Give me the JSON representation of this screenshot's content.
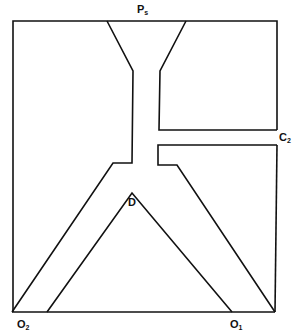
{
  "diagram": {
    "type": "fluidic-device-channel-schematic",
    "stroke_color": "#111111",
    "background": "#ffffff",
    "labels": {
      "supply": {
        "main": "P",
        "sub": "s"
      },
      "control": {
        "main": "C",
        "sub": "2"
      },
      "divider": {
        "main": "D",
        "sub": ""
      },
      "output_left": {
        "main": "O",
        "sub": "2"
      },
      "output_right": {
        "main": "O",
        "sub": "1"
      }
    },
    "nodes": [
      "Ps",
      "C2",
      "D",
      "O2",
      "O1"
    ],
    "edges": [
      {
        "from": "Ps",
        "to": "D",
        "label": "supply nozzle"
      },
      {
        "from": "C2",
        "to": "D",
        "label": "control port"
      },
      {
        "from": "D",
        "to": "O2",
        "label": "left output channel"
      },
      {
        "from": "D",
        "to": "O1",
        "label": "right output channel"
      }
    ]
  }
}
